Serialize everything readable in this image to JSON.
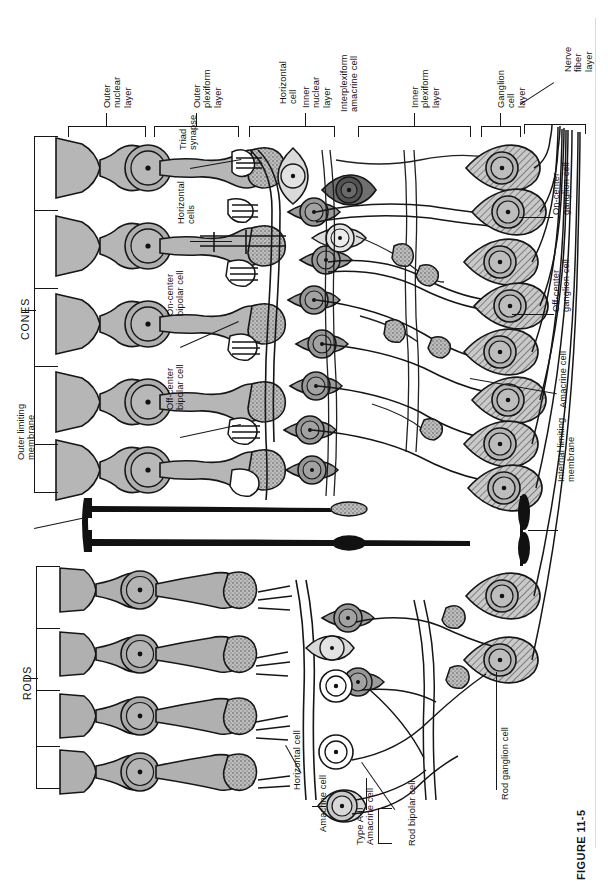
{
  "figure": {
    "caption_label": "FIGURE 11-5",
    "orientation": "rotated-90",
    "page_background": "#ffffff"
  },
  "colors": {
    "ink": "#161616",
    "cone_fill": "#b6b6b6",
    "rod_fill": "#b0b0b0",
    "bipolar_fill": "#9b9b9b",
    "bipolar_dark_fill": "#6f6f6f",
    "pale_fill": "#dcdcdc",
    "ganglion_hatch": "#a8a8a8",
    "muller_fill": "#111111",
    "white": "#ffffff",
    "page_edge": "#d9d9d9"
  },
  "layer_brackets": [
    {
      "id": "outer-nuclear-layer",
      "label": "Outer\nnuclear\nlayer"
    },
    {
      "id": "outer-plexiform-layer",
      "label": "Outer\nplexiform\nlayer"
    },
    {
      "id": "inner-nuclear-layer",
      "label": "Inner\nnuclear\nlayer"
    },
    {
      "id": "inner-plexiform-layer",
      "label": "Inner\nplexiform\nlayer"
    },
    {
      "id": "ganglion-cell-layer",
      "label": "Ganglion\ncell\nlayer"
    },
    {
      "id": "nerve-fiber-layer",
      "label": "Nerve\nfiber\nlayer"
    }
  ],
  "layer_labels": {
    "outer_nuclear": [
      "Outer",
      "nuclear",
      "layer"
    ],
    "outer_plexiform": [
      "Outer",
      "plexiform",
      "layer"
    ],
    "inner_nuclear": [
      "Inner",
      "nuclear",
      "layer"
    ],
    "inner_plexiform": [
      "Inner",
      "plexiform",
      "layer"
    ],
    "ganglion_cell": [
      "Ganglion",
      "cell",
      "layer"
    ],
    "nerve_fiber": [
      "Nerve",
      "fiber",
      "layer"
    ]
  },
  "photoreceptor_groups": [
    {
      "id": "cones",
      "label": "CONES"
    },
    {
      "id": "rods",
      "label": "RODS"
    }
  ],
  "callouts": [
    {
      "id": "triad-synapse",
      "lines": [
        "Triad",
        "synapse"
      ]
    },
    {
      "id": "horizontal-cells",
      "lines": [
        "Horizontal",
        "cells"
      ]
    },
    {
      "id": "horizontal-cell-top",
      "lines": [
        "Horizontal",
        "cell"
      ]
    },
    {
      "id": "interplexiform-amacrine-cell",
      "lines": [
        "Interplexiform",
        "amacrine cell"
      ]
    },
    {
      "id": "on-center-bipolar-cell",
      "lines": [
        "On-center",
        "bipolar cell"
      ]
    },
    {
      "id": "off-center-bipolar-cell",
      "lines": [
        "Off-center",
        "bipolar cell"
      ]
    },
    {
      "id": "on-center-ganglion-cell",
      "lines": [
        "On-center",
        "ganglion cell"
      ]
    },
    {
      "id": "off-center-ganglion-cell",
      "lines": [
        "Off-center",
        "ganglion cell"
      ]
    },
    {
      "id": "amacrine-cell-right",
      "lines": [
        "Amacrine cell"
      ]
    },
    {
      "id": "outer-limiting-membrane",
      "lines": [
        "Outer limiting",
        "membrane"
      ]
    },
    {
      "id": "internal-limiting-membrane",
      "lines": [
        "Internal limiting",
        "membrane"
      ]
    },
    {
      "id": "horizontal-cell-bottom",
      "lines": [
        "Horizontal cell"
      ]
    },
    {
      "id": "amacrine-cell-bottom",
      "lines": [
        "Amacrine cell"
      ]
    },
    {
      "id": "type-a2-amacrine-cell",
      "lines": [
        "Type A-II",
        "Amacrine cell"
      ]
    },
    {
      "id": "rod-bipolar-cell",
      "lines": [
        "Rod bipolar cell"
      ]
    },
    {
      "id": "rod-ganglion-cell",
      "lines": [
        "Rod ganglion cell"
      ]
    }
  ],
  "text": {
    "outer_nuclear_1": "Outer",
    "outer_nuclear_2": "nuclear",
    "outer_nuclear_3": "layer",
    "outer_plexiform_1": "Outer",
    "outer_plexiform_2": "plexiform",
    "outer_plexiform_3": "layer",
    "horizontal_cell_top_1": "Horizontal",
    "horizontal_cell_top_2": "cell",
    "inner_nuclear_1": "Inner",
    "inner_nuclear_2": "nuclear",
    "inner_nuclear_3": "layer",
    "interplexiform_1": "Interplexiform",
    "interplexiform_2": "amacrine cell",
    "inner_plexiform_1": "Inner",
    "inner_plexiform_2": "plexiform",
    "inner_plexiform_3": "layer",
    "ganglion_cell_layer_1": "Ganglion",
    "ganglion_cell_layer_2": "cell",
    "ganglion_cell_layer_3": "layer",
    "nerve_fiber_1": "Nerve",
    "nerve_fiber_2": "fiber",
    "nerve_fiber_3": "layer",
    "triad_1": "Triad",
    "triad_2": "synapse",
    "horizontal_cells_1": "Horizontal",
    "horizontal_cells_2": "cells",
    "on_center_bipolar_1": "On-center",
    "on_center_bipolar_2": "bipolar cell",
    "off_center_bipolar_1": "Off-center",
    "off_center_bipolar_2": "bipolar cell",
    "on_center_ganglion_1": "On-center",
    "on_center_ganglion_2": "ganglion cell",
    "off_center_ganglion_1": "Off-center",
    "off_center_ganglion_2": "ganglion cell",
    "amacrine_cell_right": "Amacrine cell",
    "outer_limiting_1": "Outer limiting",
    "outer_limiting_2": "membrane",
    "internal_limiting_1": "Internal limiting",
    "internal_limiting_2": "membrane",
    "cones": "CONES",
    "rods": "RODS",
    "horizontal_cell_bottom": "Horizontal cell",
    "amacrine_cell_bottom": "Amacrine cell",
    "type_a2_1": "Type A-II",
    "type_a2_2": "Amacrine cell",
    "rod_bipolar_cell": "Rod bipolar cell",
    "rod_ganglion_cell": "Rod ganglion cell",
    "figure_caption": "FIGURE 11-5"
  }
}
